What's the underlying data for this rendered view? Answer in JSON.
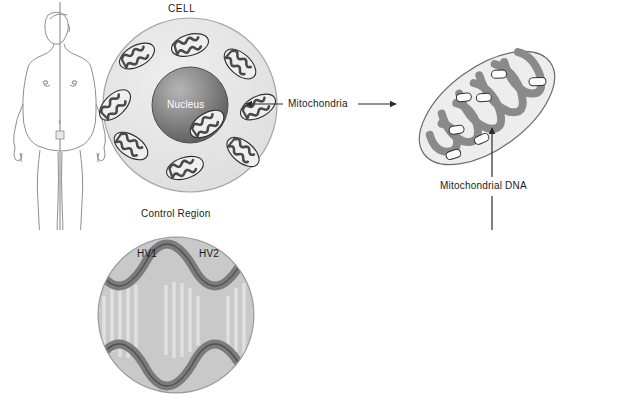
{
  "figure": {
    "kind": "biology-diagram",
    "background_color": "#ffffff"
  },
  "labels": {
    "cell": "CELL",
    "nucleus": "Nucleus",
    "mitochondria": "Mitochondria",
    "mitochondrial_dna": "Mitochondrial DNA",
    "control_region": "Control Region",
    "hv1": "HV1",
    "hv2": "HV2"
  },
  "panels": {
    "human": {
      "name": "human-body-figure",
      "description": "line drawing of standing human body, front view"
    },
    "cell": {
      "name": "cell-panel",
      "label": "CELL",
      "nucleus_label": "Nucleus",
      "mitochondria_count": 9
    },
    "mitochondrion": {
      "name": "enlarged-mitochondrion",
      "cristae_count": 5,
      "mtdna_nucleoid_count": 7
    },
    "genome": {
      "name": "circular-mtdna-genome",
      "shape": "closed circular double helix loop",
      "highlight_label": "Control Region"
    },
    "control_region": {
      "name": "control-region-closeup",
      "label": "Control Region",
      "hypervariable_segments": [
        "HV1",
        "HV2"
      ]
    }
  },
  "connectors": [
    {
      "name": "arrow-cell-to-mitochondria-label",
      "type": "arrow",
      "direction": "left",
      "from": "Mitochondria",
      "to": "cell mitochondrion"
    },
    {
      "name": "arrow-mitochondria-label-to-organelle",
      "type": "arrow",
      "direction": "right",
      "from": "Mitochondria",
      "to": "enlarged mitochondrion"
    },
    {
      "name": "arrow-mtdna-to-organelle",
      "type": "arrow",
      "direction": "up",
      "from": "Mitochondrial DNA",
      "to": "nucleoid in mitochondrion"
    },
    {
      "name": "arrow-mtdna-to-genome",
      "type": "arrow",
      "direction": "down",
      "from": "Mitochondrial DNA",
      "to": "circular genome"
    },
    {
      "name": "leader-line-top",
      "type": "dashed",
      "from": "control region closeup",
      "to": "genome highlight"
    },
    {
      "name": "leader-line-bottom",
      "type": "dashed",
      "from": "control region closeup",
      "to": "genome highlight"
    }
  ],
  "colors": {
    "outline": "#3a3a3a",
    "cell_fill": "#e6e6e6",
    "nucleus_dark": "#5a5a5a",
    "nucleus_light": "#a8a8a8",
    "organelle_fill": "#ededed",
    "cristae": "#8a8a8a",
    "helix_backbone": "#6e6e6e",
    "helix_rung": "#d2d2d2",
    "highlight_circle": "#c9c9c9",
    "label_text": "#1a1a1a"
  }
}
